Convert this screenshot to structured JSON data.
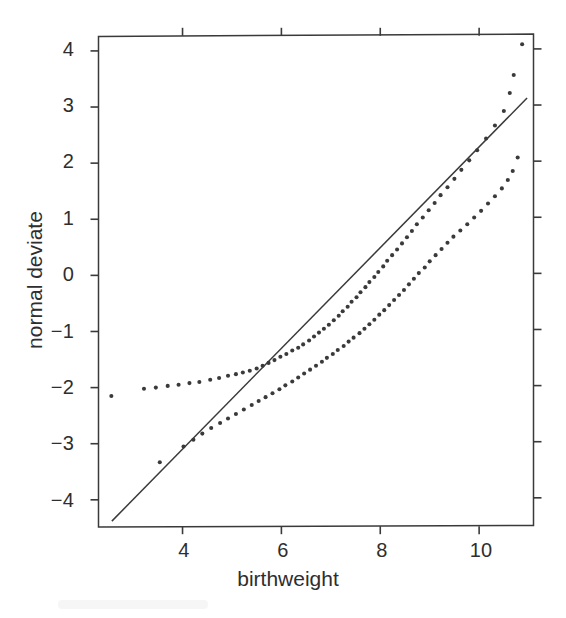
{
  "figure": {
    "background_color": "#ffffff",
    "ink_color": "#3a3a3a",
    "text_color": "#2e2e2e"
  },
  "axes": {
    "x_title": "birthweight",
    "y_title": "normal deviate",
    "x_ticks": [
      "4",
      "6",
      "8",
      "10"
    ],
    "y_ticks": [
      "4",
      "3",
      "2",
      "1",
      "0",
      "−1",
      "−2",
      "−3",
      "−4"
    ]
  },
  "chart_data": {
    "type": "scatter",
    "title": "",
    "subtitle": "",
    "xlabel": "birthweight",
    "ylabel": "normal deviate",
    "xlim": [
      2.3,
      11.1
    ],
    "ylim": [
      -4.47,
      4.28
    ],
    "x_ticks": [
      4,
      6,
      8,
      10
    ],
    "y_ticks": [
      4,
      3,
      2,
      1,
      0,
      -1,
      -2,
      -3,
      -4
    ],
    "grid": false,
    "legend": "none",
    "marker": "dot",
    "marker_size_px": 3,
    "series": [
      {
        "name": "group-a",
        "style": "dots",
        "points": [
          [
            2.56,
            -2.15
          ],
          [
            3.22,
            -2.02
          ],
          [
            3.46,
            -2.0
          ],
          [
            3.7,
            -1.97
          ],
          [
            3.92,
            -1.95
          ],
          [
            4.14,
            -1.92
          ],
          [
            4.34,
            -1.9
          ],
          [
            4.56,
            -1.86
          ],
          [
            4.74,
            -1.83
          ],
          [
            4.92,
            -1.79
          ],
          [
            5.08,
            -1.76
          ],
          [
            5.22,
            -1.73
          ],
          [
            5.36,
            -1.7
          ],
          [
            5.5,
            -1.66
          ],
          [
            5.62,
            -1.61
          ],
          [
            5.74,
            -1.56
          ],
          [
            5.86,
            -1.51
          ],
          [
            5.98,
            -1.45
          ],
          [
            6.1,
            -1.4
          ],
          [
            6.22,
            -1.34
          ],
          [
            6.34,
            -1.29
          ],
          [
            6.44,
            -1.23
          ],
          [
            6.56,
            -1.16
          ],
          [
            6.66,
            -1.09
          ],
          [
            6.76,
            -1.02
          ],
          [
            6.86,
            -0.95
          ],
          [
            6.96,
            -0.88
          ],
          [
            7.06,
            -0.8
          ],
          [
            7.16,
            -0.72
          ],
          [
            7.24,
            -0.64
          ],
          [
            7.34,
            -0.56
          ],
          [
            7.42,
            -0.47
          ],
          [
            7.52,
            -0.39
          ],
          [
            7.6,
            -0.3
          ],
          [
            7.7,
            -0.21
          ],
          [
            7.78,
            -0.12
          ],
          [
            7.88,
            -0.03
          ],
          [
            7.96,
            0.06
          ],
          [
            8.06,
            0.16
          ],
          [
            8.14,
            0.26
          ],
          [
            8.24,
            0.36
          ],
          [
            8.34,
            0.46
          ],
          [
            8.44,
            0.57
          ],
          [
            8.54,
            0.68
          ],
          [
            8.64,
            0.79
          ],
          [
            8.74,
            0.91
          ],
          [
            8.86,
            1.03
          ],
          [
            8.98,
            1.16
          ],
          [
            9.1,
            1.29
          ],
          [
            9.22,
            1.43
          ],
          [
            9.36,
            1.57
          ],
          [
            9.5,
            1.72
          ],
          [
            9.64,
            1.88
          ],
          [
            9.8,
            2.05
          ],
          [
            9.96,
            2.23
          ],
          [
            10.14,
            2.44
          ],
          [
            10.32,
            2.67
          ],
          [
            10.5,
            2.93
          ],
          [
            10.62,
            3.25
          ],
          [
            10.7,
            3.57
          ],
          [
            10.87,
            4.12
          ]
        ]
      },
      {
        "name": "group-b",
        "style": "dots",
        "points": [
          [
            3.54,
            -3.33
          ],
          [
            4.02,
            -3.05
          ],
          [
            4.22,
            -2.93
          ],
          [
            4.4,
            -2.82
          ],
          [
            4.58,
            -2.72
          ],
          [
            4.76,
            -2.63
          ],
          [
            4.92,
            -2.55
          ],
          [
            5.08,
            -2.47
          ],
          [
            5.24,
            -2.39
          ],
          [
            5.4,
            -2.31
          ],
          [
            5.54,
            -2.24
          ],
          [
            5.68,
            -2.17
          ],
          [
            5.82,
            -2.1
          ],
          [
            5.96,
            -2.03
          ],
          [
            6.08,
            -1.96
          ],
          [
            6.22,
            -1.89
          ],
          [
            6.34,
            -1.82
          ],
          [
            6.46,
            -1.75
          ],
          [
            6.58,
            -1.68
          ],
          [
            6.7,
            -1.61
          ],
          [
            6.82,
            -1.54
          ],
          [
            6.92,
            -1.47
          ],
          [
            7.04,
            -1.4
          ],
          [
            7.14,
            -1.33
          ],
          [
            7.26,
            -1.26
          ],
          [
            7.36,
            -1.18
          ],
          [
            7.46,
            -1.11
          ],
          [
            7.58,
            -1.03
          ],
          [
            7.68,
            -0.95
          ],
          [
            7.78,
            -0.87
          ],
          [
            7.88,
            -0.79
          ],
          [
            7.98,
            -0.7
          ],
          [
            8.08,
            -0.62
          ],
          [
            8.18,
            -0.53
          ],
          [
            8.28,
            -0.44
          ],
          [
            8.38,
            -0.35
          ],
          [
            8.48,
            -0.26
          ],
          [
            8.58,
            -0.16
          ],
          [
            8.68,
            -0.06
          ],
          [
            8.78,
            0.04
          ],
          [
            8.9,
            0.14
          ],
          [
            9.0,
            0.25
          ],
          [
            9.12,
            0.36
          ],
          [
            9.24,
            0.47
          ],
          [
            9.36,
            0.58
          ],
          [
            9.48,
            0.69
          ],
          [
            9.62,
            0.8
          ],
          [
            9.76,
            0.91
          ],
          [
            9.9,
            1.03
          ],
          [
            10.04,
            1.15
          ],
          [
            10.18,
            1.28
          ],
          [
            10.32,
            1.41
          ],
          [
            10.46,
            1.55
          ],
          [
            10.58,
            1.7
          ],
          [
            10.68,
            1.86
          ],
          [
            10.78,
            2.1
          ]
        ]
      }
    ],
    "reference_line": {
      "name": "reference-line",
      "style": "solid",
      "x": [
        2.57,
        10.97
      ],
      "y": [
        -4.38,
        3.16
      ]
    }
  }
}
